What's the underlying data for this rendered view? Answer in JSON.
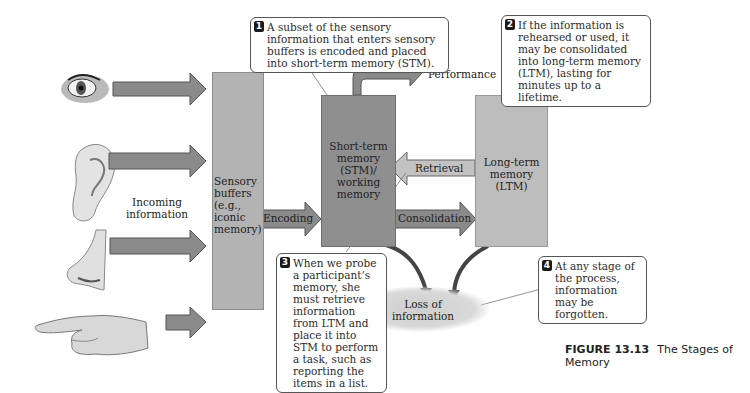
{
  "figure": {
    "caption_number": "FIGURE 13.13",
    "caption_title": "The Stages of Memory"
  },
  "senses": [
    {
      "name": "eye",
      "icon": "eye-icon"
    },
    {
      "name": "ear",
      "icon": "ear-icon"
    },
    {
      "name": "nose",
      "icon": "nose-icon"
    },
    {
      "name": "hand",
      "icon": "pointing-hand-icon"
    }
  ],
  "labels": {
    "incoming": "Incoming information",
    "sensory": [
      "Sensory",
      "buffers",
      "(e.g.,",
      "iconic",
      "memory)"
    ],
    "stm": [
      "Short-term",
      "memory",
      "(STM)/",
      "working",
      "memory"
    ],
    "ltm": [
      "Long-term",
      "memory",
      "(LTM)"
    ],
    "encoding": "Encoding",
    "consolidation": "Consolidation",
    "retrieval": "Retrieval",
    "performance": "Performance",
    "loss": [
      "Loss of",
      "information"
    ]
  },
  "callouts": [
    {
      "number": "1",
      "text": "A subset of the sensory information that enters sensory buffers is encoded and placed into short-term memory (STM)."
    },
    {
      "number": "2",
      "text": "If the information is rehearsed or used, it may be consolidated into long-term memory (LTM), lasting for minutes up to a lifetime."
    },
    {
      "number": "3",
      "text": "When we probe a participant’s memory, she must retrieve information from LTM and place it into STM to perform a task, such as reporting the items in a list."
    },
    {
      "number": "4",
      "text": "At any stage of the process, information may be forgotten."
    }
  ],
  "colors": {
    "sensory_box": "#b3b3b3",
    "stm_box": "#8f8f8f",
    "ltm_box": "#bdbdbd",
    "arrow_dark": "#8a8a8a",
    "arrow_light": "#c2c2c2",
    "callout_border": "#555555"
  }
}
